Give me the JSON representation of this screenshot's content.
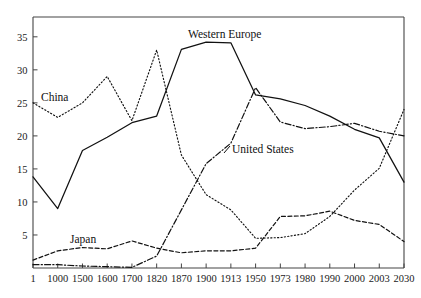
{
  "chart_data": {
    "type": "line",
    "title": "",
    "subtitle": "",
    "xlabel": "",
    "ylabel": "",
    "grid": false,
    "legend_position": "inline-annotations",
    "x": [
      "1",
      "1000",
      "1500",
      "1600",
      "1700",
      "1820",
      "1870",
      "1900",
      "1913",
      "1950",
      "1973",
      "1980",
      "1990",
      "2000",
      "2003",
      "2030"
    ],
    "xtick_labels": [
      "1",
      "1000",
      "1500",
      "1600",
      "1700",
      "1820",
      "1870",
      "1900",
      "1913",
      "1950",
      "1973",
      "1980",
      "1990",
      "2000",
      "2003",
      "2030"
    ],
    "ytick_labels": [
      "5",
      "10",
      "15",
      "20",
      "25",
      "30",
      "35"
    ],
    "yticks": [
      5,
      10,
      15,
      20,
      25,
      30,
      35
    ],
    "ylim": [
      0,
      38
    ],
    "series": [
      {
        "name": "Western Europe",
        "style": "solid",
        "label": "Western Europe",
        "values": [
          13.8,
          9.0,
          17.8,
          19.8,
          22.0,
          23.0,
          33.1,
          34.2,
          34.1,
          26.2,
          25.6,
          24.6,
          23.0,
          21.0,
          19.7,
          13.0
        ]
      },
      {
        "name": "China",
        "style": "dotted",
        "label": "China",
        "values": [
          25.0,
          22.8,
          25.0,
          29.0,
          22.3,
          33.0,
          17.1,
          11.1,
          8.8,
          4.5,
          4.6,
          5.2,
          7.8,
          11.8,
          15.1,
          24.0
        ]
      },
      {
        "name": "United States",
        "style": "dashdot",
        "label": "United States",
        "values": [
          0.5,
          0.5,
          0.3,
          0.2,
          0.1,
          1.8,
          8.8,
          15.8,
          18.9,
          27.3,
          22.1,
          21.1,
          21.4,
          21.9,
          20.7,
          20.0
        ]
      },
      {
        "name": "Japan",
        "style": "dashed",
        "label": "Japan",
        "values": [
          1.2,
          2.6,
          3.1,
          2.9,
          4.1,
          3.0,
          2.3,
          2.6,
          2.6,
          3.0,
          7.8,
          7.9,
          8.6,
          7.2,
          6.6,
          4.0
        ]
      }
    ],
    "annotations": [
      {
        "text": "Western Europe",
        "series": "Western Europe"
      },
      {
        "text": "China",
        "series": "China"
      },
      {
        "text": "United States",
        "series": "United States"
      },
      {
        "text": "Japan",
        "series": "Japan"
      }
    ]
  }
}
